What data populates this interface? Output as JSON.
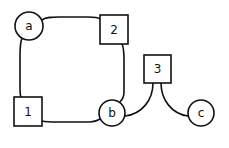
{
  "diagram": {
    "type": "bipartite-graph",
    "background": "#ffffff",
    "stroke_color": "#111111",
    "nodes": [
      {
        "id": "a",
        "label": "a",
        "shape": "circle",
        "cx": 29,
        "cy": 26,
        "r": 14
      },
      {
        "id": "b",
        "label": "b",
        "shape": "circle",
        "cx": 112,
        "cy": 113,
        "r": 13
      },
      {
        "id": "c",
        "label": "c",
        "shape": "circle",
        "cx": 201,
        "cy": 113,
        "r": 13
      },
      {
        "id": "1",
        "label": "1",
        "shape": "square",
        "x": 14,
        "y": 97,
        "w": 28,
        "h": 29
      },
      {
        "id": "2",
        "label": "2",
        "shape": "square",
        "x": 100,
        "y": 15,
        "w": 28,
        "h": 29
      },
      {
        "id": "3",
        "label": "3",
        "shape": "square",
        "x": 144,
        "y": 55,
        "w": 27,
        "h": 28
      }
    ],
    "edges": [
      {
        "from": "a",
        "to": "2"
      },
      {
        "from": "a",
        "to": "1"
      },
      {
        "from": "2",
        "to": "b"
      },
      {
        "from": "1",
        "to": "b"
      },
      {
        "from": "3",
        "to": "b"
      },
      {
        "from": "3",
        "to": "c"
      }
    ]
  }
}
